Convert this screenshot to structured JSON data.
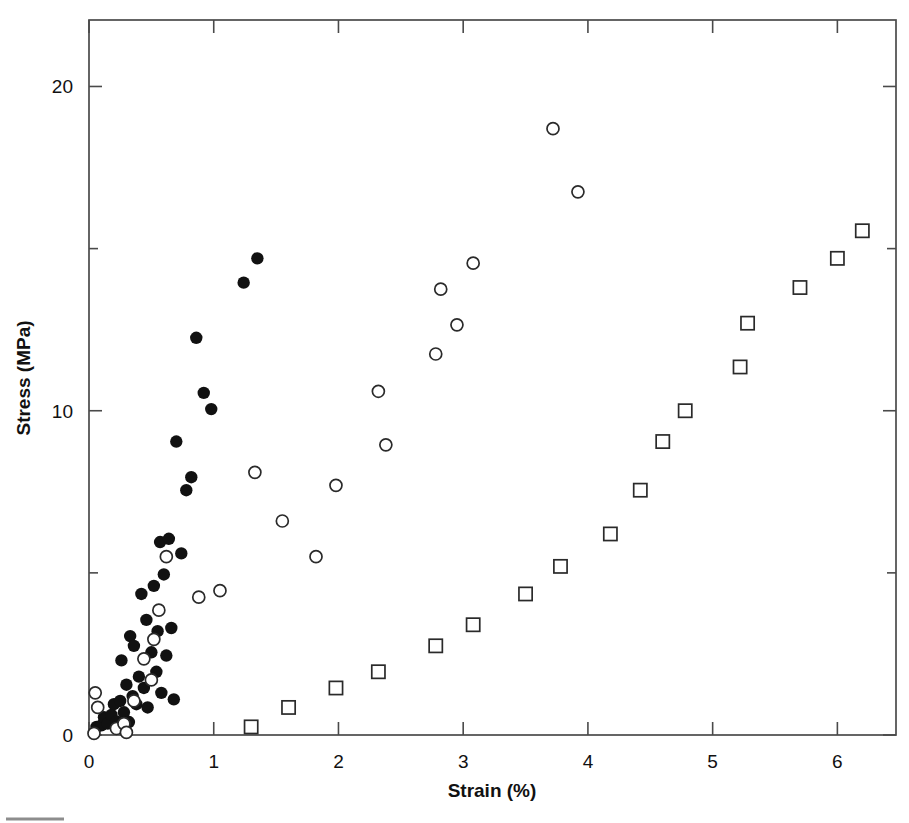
{
  "chart_data": {
    "type": "scatter",
    "title": "",
    "xlabel": "Strain (%)",
    "ylabel": "Stress (MPa)",
    "xlim": [
      0,
      6.47
    ],
    "ylim": [
      0,
      22.05
    ],
    "xticks": [
      0,
      1,
      2,
      3,
      4,
      5,
      6
    ],
    "xtick_labels": [
      "0",
      "1",
      "2",
      "3",
      "4",
      "5",
      "6"
    ],
    "yticks": [
      0,
      10,
      20
    ],
    "ytick_labels": [
      "0",
      "10",
      "20"
    ],
    "yminor_ticks": [
      5,
      15
    ],
    "grid": false,
    "legend": "none",
    "frame": "box",
    "tick_direction": "in",
    "series": [
      {
        "name": "filled-circle-series",
        "marker": "filled-circle",
        "color": "#111111",
        "points": [
          [
            0.06,
            0.25
          ],
          [
            0.1,
            0.3
          ],
          [
            0.12,
            0.55
          ],
          [
            0.15,
            0.35
          ],
          [
            0.18,
            0.62
          ],
          [
            0.2,
            0.95
          ],
          [
            0.22,
            0.42
          ],
          [
            0.25,
            1.05
          ],
          [
            0.26,
            2.3
          ],
          [
            0.28,
            0.7
          ],
          [
            0.3,
            1.55
          ],
          [
            0.32,
            0.4
          ],
          [
            0.33,
            3.05
          ],
          [
            0.35,
            1.2
          ],
          [
            0.36,
            2.75
          ],
          [
            0.38,
            0.95
          ],
          [
            0.4,
            1.8
          ],
          [
            0.42,
            4.35
          ],
          [
            0.44,
            1.45
          ],
          [
            0.46,
            3.55
          ],
          [
            0.47,
            0.85
          ],
          [
            0.5,
            2.55
          ],
          [
            0.52,
            4.6
          ],
          [
            0.54,
            1.95
          ],
          [
            0.55,
            3.2
          ],
          [
            0.57,
            5.95
          ],
          [
            0.58,
            1.3
          ],
          [
            0.6,
            4.95
          ],
          [
            0.62,
            2.45
          ],
          [
            0.64,
            6.05
          ],
          [
            0.66,
            3.3
          ],
          [
            0.68,
            1.1
          ],
          [
            0.7,
            9.05
          ],
          [
            0.74,
            5.6
          ],
          [
            0.78,
            7.55
          ],
          [
            0.82,
            7.95
          ],
          [
            0.86,
            12.25
          ],
          [
            0.92,
            10.55
          ],
          [
            0.98,
            10.05
          ],
          [
            1.24,
            13.95
          ],
          [
            1.35,
            14.7
          ]
        ]
      },
      {
        "name": "open-circle-series",
        "marker": "open-circle",
        "color": "#2a2a2a",
        "points": [
          [
            0.04,
            0.05
          ],
          [
            0.05,
            1.3
          ],
          [
            0.07,
            0.85
          ],
          [
            0.22,
            0.2
          ],
          [
            0.28,
            0.35
          ],
          [
            0.3,
            0.08
          ],
          [
            0.36,
            1.05
          ],
          [
            0.44,
            2.35
          ],
          [
            0.5,
            1.7
          ],
          [
            0.52,
            2.95
          ],
          [
            0.56,
            3.85
          ],
          [
            0.62,
            5.5
          ],
          [
            0.88,
            4.25
          ],
          [
            1.05,
            4.45
          ],
          [
            1.33,
            8.1
          ],
          [
            1.55,
            6.6
          ],
          [
            1.82,
            5.5
          ],
          [
            1.98,
            7.7
          ],
          [
            2.32,
            10.6
          ],
          [
            2.38,
            8.95
          ],
          [
            2.78,
            11.75
          ],
          [
            2.82,
            13.75
          ],
          [
            2.95,
            12.65
          ],
          [
            3.08,
            14.55
          ],
          [
            3.72,
            18.7
          ],
          [
            3.92,
            16.75
          ]
        ]
      },
      {
        "name": "open-square-series",
        "marker": "open-square",
        "color": "#2a2a2a",
        "points": [
          [
            1.3,
            0.25
          ],
          [
            1.6,
            0.85
          ],
          [
            1.98,
            1.45
          ],
          [
            2.32,
            1.95
          ],
          [
            2.78,
            2.75
          ],
          [
            3.08,
            3.4
          ],
          [
            3.5,
            4.35
          ],
          [
            3.78,
            5.2
          ],
          [
            4.18,
            6.2
          ],
          [
            4.42,
            7.55
          ],
          [
            4.6,
            9.05
          ],
          [
            4.78,
            10.0
          ],
          [
            5.22,
            11.35
          ],
          [
            5.28,
            12.7
          ],
          [
            5.7,
            13.8
          ],
          [
            6.0,
            14.7
          ],
          [
            6.2,
            15.55
          ]
        ]
      }
    ]
  },
  "figure": {
    "caption_rule": true
  }
}
